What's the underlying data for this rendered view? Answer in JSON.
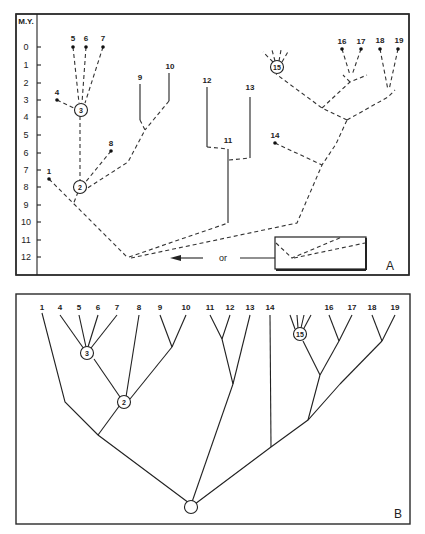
{
  "panelA": {
    "label": "A",
    "axis_title": "M.Y.",
    "axis_ticks": [
      "0",
      "1",
      "2",
      "3",
      "4",
      "5",
      "6",
      "7",
      "8",
      "9",
      "10",
      "11",
      "12"
    ],
    "taxa": [
      {
        "id": "1",
        "label": "1"
      },
      {
        "id": "4",
        "label": "4"
      },
      {
        "id": "5",
        "label": "5"
      },
      {
        "id": "6",
        "label": "6"
      },
      {
        "id": "7",
        "label": "7"
      },
      {
        "id": "8",
        "label": "8"
      },
      {
        "id": "9",
        "label": "9"
      },
      {
        "id": "10",
        "label": "10"
      },
      {
        "id": "11",
        "label": "11"
      },
      {
        "id": "12",
        "label": "12"
      },
      {
        "id": "13",
        "label": "13"
      },
      {
        "id": "14",
        "label": "14"
      },
      {
        "id": "16",
        "label": "16"
      },
      {
        "id": "17",
        "label": "17"
      },
      {
        "id": "18",
        "label": "18"
      },
      {
        "id": "19",
        "label": "19"
      }
    ],
    "ancestor_nodes": [
      "2",
      "3",
      "15"
    ],
    "inset_connector_label": "or"
  },
  "panelB": {
    "label": "B",
    "tips": [
      "1",
      "4",
      "5",
      "6",
      "7",
      "8",
      "9",
      "10",
      "11",
      "12",
      "13",
      "14",
      "16",
      "17",
      "18",
      "19"
    ],
    "ancestor_nodes": [
      "3",
      "2",
      "15"
    ]
  }
}
